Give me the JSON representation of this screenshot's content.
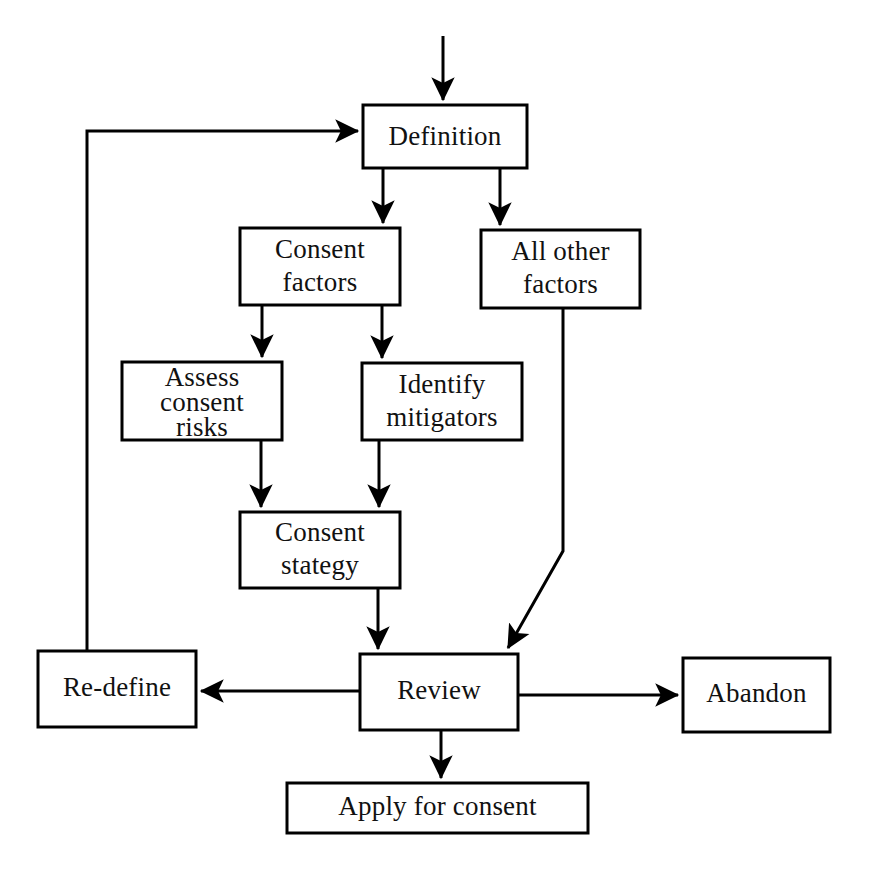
{
  "diagram": {
    "background_color": "#ffffff",
    "line_color": "#000000",
    "text_color": "#111111",
    "nodes": [
      {
        "id": "definition",
        "label": "Definition",
        "lines": [
          "Definition"
        ],
        "x": 363,
        "y": 105,
        "w": 164,
        "h": 63
      },
      {
        "id": "consent-factors",
        "label": "Consent factors",
        "lines": [
          "Consent",
          "factors"
        ],
        "x": 240,
        "y": 228,
        "w": 160,
        "h": 77
      },
      {
        "id": "all-other-factors",
        "label": "All other factors",
        "lines": [
          "All other",
          "factors"
        ],
        "x": 481,
        "y": 230,
        "w": 159,
        "h": 78
      },
      {
        "id": "assess-consent-risks",
        "label": "Assess consent risks",
        "lines": [
          "Assess",
          "consent",
          "risks"
        ],
        "x": 122,
        "y": 362,
        "w": 160,
        "h": 78
      },
      {
        "id": "identify-mitigators",
        "label": "Identify mitigators",
        "lines": [
          "Identify",
          "mitigators"
        ],
        "x": 362,
        "y": 363,
        "w": 160,
        "h": 77
      },
      {
        "id": "consent-stategy",
        "label": "Consent stategy",
        "lines": [
          "Consent",
          "stategy"
        ],
        "x": 240,
        "y": 512,
        "w": 160,
        "h": 76
      },
      {
        "id": "re-define",
        "label": "Re-define",
        "lines": [
          "Re-define"
        ],
        "x": 38,
        "y": 651,
        "w": 158,
        "h": 76
      },
      {
        "id": "review",
        "label": "Review",
        "lines": [
          "Review"
        ],
        "x": 360,
        "y": 654,
        "w": 158,
        "h": 76
      },
      {
        "id": "abandon",
        "label": "Abandon",
        "lines": [
          "Abandon"
        ],
        "x": 683,
        "y": 658,
        "w": 147,
        "h": 74
      },
      {
        "id": "apply-for-consent",
        "label": "Apply for consent",
        "lines": [
          "Apply for consent"
        ],
        "x": 287,
        "y": 783,
        "w": 301,
        "h": 50
      }
    ],
    "edges": [
      {
        "id": "start-to-definition",
        "from": "start",
        "to": "definition",
        "arrow": true
      },
      {
        "id": "definition-to-consent-factors",
        "from": "definition",
        "to": "consent-factors",
        "arrow": true
      },
      {
        "id": "definition-to-all-other-factors",
        "from": "definition",
        "to": "all-other-factors",
        "arrow": true
      },
      {
        "id": "consent-factors-to-assess-risks",
        "from": "consent-factors",
        "to": "assess-consent-risks",
        "arrow": true
      },
      {
        "id": "consent-factors-to-identify-mitigators",
        "from": "consent-factors",
        "to": "identify-mitigators",
        "arrow": true
      },
      {
        "id": "assess-risks-to-consent-stategy",
        "from": "assess-consent-risks",
        "to": "consent-stategy",
        "arrow": true
      },
      {
        "id": "identify-mitigators-to-consent-stategy",
        "from": "identify-mitigators",
        "to": "consent-stategy",
        "arrow": true
      },
      {
        "id": "consent-stategy-to-review",
        "from": "consent-stategy",
        "to": "review",
        "arrow": true
      },
      {
        "id": "all-other-factors-to-review",
        "from": "all-other-factors",
        "to": "review",
        "arrow": true
      },
      {
        "id": "review-to-re-define",
        "from": "review",
        "to": "re-define",
        "arrow": true
      },
      {
        "id": "review-to-abandon",
        "from": "review",
        "to": "abandon",
        "arrow": true
      },
      {
        "id": "review-to-apply-for-consent",
        "from": "review",
        "to": "apply-for-consent",
        "arrow": true
      },
      {
        "id": "re-define-to-definition",
        "from": "re-define",
        "to": "definition",
        "arrow": true
      }
    ]
  }
}
